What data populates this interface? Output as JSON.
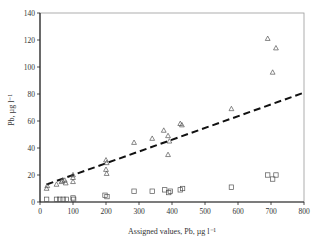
{
  "chart_data": {
    "type": "scatter",
    "title": "",
    "xlabel": "Assigned values, Pb, µg l⁻¹",
    "ylabel": "Pb, µg l⁻¹",
    "xlim": [
      0,
      800
    ],
    "ylim": [
      0,
      140
    ],
    "xticks": [
      0,
      100,
      200,
      300,
      400,
      500,
      600,
      700,
      800
    ],
    "yticks": [
      0,
      20,
      40,
      60,
      80,
      100,
      120,
      140
    ],
    "grid": false,
    "legend": null,
    "series": [
      {
        "name": "triangles",
        "marker": "triangle-open",
        "points": [
          [
            20,
            10
          ],
          [
            22,
            12
          ],
          [
            50,
            13
          ],
          [
            65,
            15
          ],
          [
            68,
            16
          ],
          [
            75,
            16
          ],
          [
            78,
            14
          ],
          [
            100,
            20
          ],
          [
            100,
            18
          ],
          [
            100,
            15
          ],
          [
            200,
            31
          ],
          [
            202,
            29
          ],
          [
            200,
            24
          ],
          [
            202,
            21
          ],
          [
            285,
            44
          ],
          [
            340,
            47
          ],
          [
            375,
            53
          ],
          [
            388,
            49
          ],
          [
            392,
            45
          ],
          [
            388,
            35
          ],
          [
            425,
            58
          ],
          [
            430,
            57
          ],
          [
            580,
            69
          ],
          [
            690,
            121
          ],
          [
            705,
            96
          ],
          [
            715,
            114
          ]
        ]
      },
      {
        "name": "squares",
        "marker": "square-open",
        "points": [
          [
            20,
            2
          ],
          [
            50,
            2
          ],
          [
            60,
            2
          ],
          [
            70,
            2
          ],
          [
            80,
            2
          ],
          [
            100,
            3
          ],
          [
            102,
            2
          ],
          [
            197,
            5
          ],
          [
            203,
            4
          ],
          [
            285,
            8
          ],
          [
            340,
            8
          ],
          [
            378,
            9
          ],
          [
            390,
            7
          ],
          [
            395,
            8
          ],
          [
            425,
            9
          ],
          [
            432,
            10
          ],
          [
            580,
            11
          ],
          [
            690,
            20
          ],
          [
            705,
            17
          ],
          [
            715,
            20
          ]
        ]
      },
      {
        "name": "regression",
        "style": "dashed-line",
        "points": [
          [
            20,
            13
          ],
          [
            800,
            81
          ]
        ]
      }
    ]
  }
}
